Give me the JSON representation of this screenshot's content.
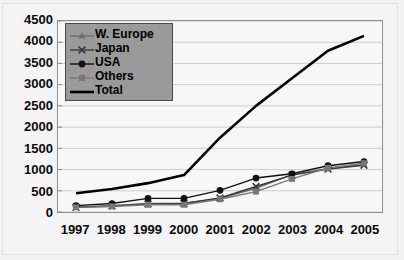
{
  "chart_data": {
    "type": "line",
    "title": "",
    "xlabel": "",
    "ylabel": "",
    "categories": [
      "1997",
      "1998",
      "1999",
      "2000",
      "2001",
      "2002",
      "2003",
      "2004",
      "2005"
    ],
    "ylim": [
      0,
      4500
    ],
    "yticks": [
      0,
      500,
      1000,
      1500,
      2000,
      2500,
      3000,
      3500,
      4000,
      4500
    ],
    "ytick_labels": [
      "0",
      "500",
      "1000",
      "1500",
      "2000",
      "2500",
      "3000",
      "3500",
      "4000",
      "4500"
    ],
    "grid": true,
    "legend_position": "top-left",
    "series": [
      {
        "name": "W. Europe",
        "marker": "triangle",
        "color": "#6e6e6e",
        "values": [
          120,
          150,
          200,
          210,
          320,
          560,
          880,
          1020,
          1120
        ]
      },
      {
        "name": "Japan",
        "marker": "cross",
        "color": "#3a3a3a",
        "values": [
          110,
          140,
          190,
          200,
          330,
          600,
          870,
          1010,
          1100
        ]
      },
      {
        "name": "USA",
        "marker": "circle",
        "color": "#111111",
        "values": [
          150,
          200,
          320,
          320,
          510,
          800,
          900,
          1090,
          1190
        ]
      },
      {
        "name": "Others",
        "marker": "square",
        "color": "#777777",
        "values": [
          110,
          130,
          170,
          170,
          300,
          480,
          780,
          1040,
          1150
        ]
      },
      {
        "name": "Total",
        "marker": "none",
        "color": "#000000",
        "values": [
          440,
          540,
          680,
          870,
          1750,
          2500,
          3150,
          3800,
          4150
        ]
      }
    ]
  },
  "legend": {
    "items": [
      {
        "label": "W. Europe"
      },
      {
        "label": "Japan"
      },
      {
        "label": "USA"
      },
      {
        "label": "Others"
      },
      {
        "label": "Total"
      }
    ]
  },
  "colors": {
    "plot_background": "#f7f7f7",
    "page_background": "#f2f2f2",
    "axis": "#8d8d8d",
    "grid": "#cccccc",
    "legend_background": "#9a9a9a",
    "legend_border": "#4a4a4a",
    "text": "#0a0a0a"
  }
}
